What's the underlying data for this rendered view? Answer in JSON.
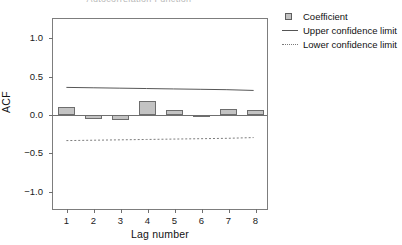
{
  "chart_data": {
    "type": "bar",
    "title": "Autocorrelation Function",
    "xlabel": "Lag number",
    "ylabel": "ACF",
    "categories": [
      1,
      2,
      3,
      4,
      5,
      6,
      7,
      8
    ],
    "values": [
      0.1,
      -0.05,
      -0.07,
      0.18,
      0.06,
      -0.02,
      0.08,
      0.06
    ],
    "series": [
      {
        "name": "Coefficient",
        "values": [
          0.1,
          -0.05,
          -0.07,
          0.18,
          0.06,
          -0.02,
          0.08,
          0.06
        ]
      },
      {
        "name": "Upper confidence limit",
        "values": [
          0.35,
          0.345,
          0.34,
          0.335,
          0.33,
          0.325,
          0.32,
          0.31
        ]
      },
      {
        "name": "Lower confidence limit",
        "values": [
          -0.35,
          -0.345,
          -0.34,
          -0.335,
          -0.33,
          -0.325,
          -0.32,
          -0.31
        ]
      }
    ],
    "ylim": [
      -1.25,
      1.25
    ],
    "yticks": [
      1.0,
      0.5,
      0.0,
      -0.5,
      -1.0
    ],
    "ytick_labels": [
      "1.0",
      "0.5",
      "0.0",
      "−0.5",
      "−1.0"
    ],
    "xticks": [
      1,
      2,
      3,
      4,
      5,
      6,
      7,
      8
    ],
    "xtick_labels": [
      "1",
      "2",
      "3",
      "4",
      "5",
      "6",
      "7",
      "8"
    ],
    "grid": false,
    "legend_position": "right-top",
    "legend": [
      {
        "label": "Coefficient",
        "key": "swatch"
      },
      {
        "label": "Upper confidence limit",
        "key": "solid-line"
      },
      {
        "label": "Lower confidence limit",
        "key": "dashed-line"
      }
    ],
    "colors": {
      "bar_fill": "#c3c3c3",
      "bar_stroke": "#6d6d6d",
      "axis": "#7d7d7d",
      "upper_limit_line": "#555555",
      "lower_limit_line": "#7a7a7a",
      "text": "#111111"
    }
  }
}
